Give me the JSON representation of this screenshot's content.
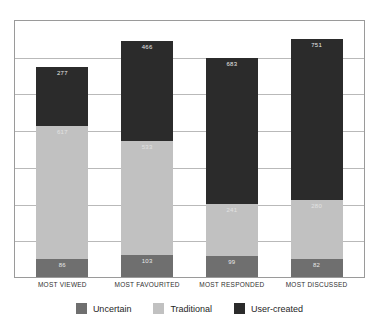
{
  "chart_data": {
    "type": "bar",
    "subtype": "stacked-bar",
    "title": "",
    "xlabel": "",
    "ylabel": "",
    "ylim": [
      0,
      1200
    ],
    "grid": true,
    "gridline_count": 6,
    "legend_position": "bottom",
    "categories": [
      "MOST VIEWED",
      "MOST FAVOURITED",
      "MOST RESPONDED",
      "MOST DISCUSSED"
    ],
    "series": [
      {
        "name": "Uncertain",
        "color": "#6f6f6f",
        "values": [
          86,
          103,
          99,
          82
        ],
        "labels": [
          "86",
          "103",
          "99",
          "82"
        ]
      },
      {
        "name": "Traditional",
        "color": "#c1c1c1",
        "values": [
          617,
          533,
          241,
          280
        ],
        "labels": [
          "617",
          "533",
          "241",
          "280"
        ]
      },
      {
        "name": "User-created",
        "color": "#2b2b2b",
        "values": [
          277,
          466,
          683,
          751
        ],
        "labels": [
          "277",
          "466",
          "683",
          "751"
        ]
      }
    ],
    "totals": [
      980,
      1102,
      1023,
      1113
    ]
  },
  "legend": {
    "items": [
      {
        "label": "Uncertain",
        "color": "#6f6f6f"
      },
      {
        "label": "Traditional",
        "color": "#c1c1c1"
      },
      {
        "label": "User-created",
        "color": "#2b2b2b"
      }
    ]
  },
  "colors": {
    "uncertain": "#6f6f6f",
    "traditional": "#c1c1c1",
    "user_created": "#2b2b2b",
    "frame": "#9a9a9a",
    "gridline": "#b9b9b9",
    "background": "#ffffff",
    "text": "#2f2f2f"
  }
}
